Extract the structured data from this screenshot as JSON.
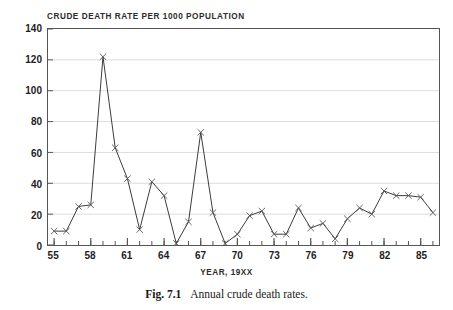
{
  "figure": {
    "caption_label": "Fig. 7.1",
    "caption_text": "Annual crude death rates."
  },
  "chart_data": {
    "type": "line",
    "title": "CRUDE DEATH RATE PER 1000 POPULATION",
    "xlabel": "YEAR, 19XX",
    "ylabel": "",
    "xlim": [
      54.5,
      86.5
    ],
    "ylim": [
      0,
      140
    ],
    "grid": true,
    "grid_axis": "y",
    "legend": "none",
    "marker": "x",
    "line_color": "#3a3a3a",
    "x": [
      55,
      56,
      57,
      58,
      59,
      60,
      61,
      62,
      63,
      64,
      65,
      66,
      67,
      68,
      69,
      70,
      71,
      72,
      73,
      74,
      75,
      76,
      77,
      78,
      79,
      80,
      81,
      82,
      83,
      84,
      85,
      86
    ],
    "values": [
      9,
      9,
      25,
      26,
      122,
      63,
      43,
      10,
      41,
      32,
      1,
      15,
      73,
      21,
      1,
      7,
      19,
      22,
      7,
      7,
      24,
      11,
      14,
      4,
      17,
      24,
      20,
      35,
      32,
      32,
      31,
      21
    ],
    "x_tick_labels": [
      "55",
      "58",
      "61",
      "64",
      "67",
      "70",
      "73",
      "76",
      "79",
      "82",
      "85"
    ],
    "x_tick_values": [
      55,
      58,
      61,
      64,
      67,
      70,
      73,
      76,
      79,
      82,
      85
    ],
    "x_minor_tick_values": [
      55,
      56,
      57,
      58,
      59,
      60,
      61,
      62,
      63,
      64,
      65,
      66,
      67,
      68,
      69,
      70,
      71,
      72,
      73,
      74,
      75,
      76,
      77,
      78,
      79,
      80,
      81,
      82,
      83,
      84,
      85,
      86
    ],
    "y_tick_labels": [
      "0",
      "20",
      "40",
      "60",
      "80",
      "100",
      "120",
      "140"
    ],
    "y_tick_values": [
      0,
      20,
      40,
      60,
      80,
      100,
      120,
      140
    ]
  }
}
